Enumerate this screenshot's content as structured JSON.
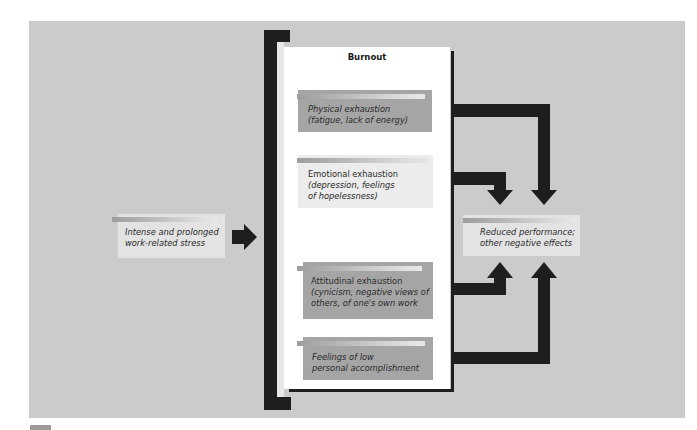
{
  "diagram": {
    "title": "Burnout",
    "input": {
      "label_line1": "Intense and prolonged",
      "label_line2": "work-related stress"
    },
    "components": [
      {
        "id": "physical",
        "line1": "Physical exhaustion",
        "line2": "(fatigue, lack of energy)",
        "style": "dark"
      },
      {
        "id": "emotional",
        "line1": "Emotional exhaustion",
        "line2": "(depression, feelings",
        "line3": "of hopelessness)",
        "style": "light"
      },
      {
        "id": "attitudinal",
        "line1": "Attitudinal exhaustion",
        "line2": "(cynicism, negative views of",
        "line3": "others, of one's own work",
        "style": "dark"
      },
      {
        "id": "accomplishment",
        "line1": "Feelings of low",
        "line2": "personal accomplishment",
        "style": "dark"
      }
    ],
    "output": {
      "label_line1": "Reduced performance;",
      "label_line2": "other negative effects"
    },
    "edges": [
      {
        "from": "input",
        "to": "burnout"
      },
      {
        "from": "physical",
        "to": "output"
      },
      {
        "from": "emotional",
        "to": "output"
      },
      {
        "from": "attitudinal",
        "to": "output"
      },
      {
        "from": "accomplishment",
        "to": "output"
      }
    ],
    "colors": {
      "background": "#cbcbcb",
      "panel": "#ffffff",
      "dark_box": "#a5a5a5",
      "light_box": "#ececec",
      "arrow": "#1e1e1e"
    }
  }
}
